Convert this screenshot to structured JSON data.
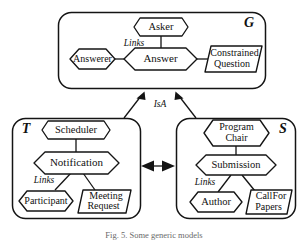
{
  "figure": {
    "caption": "Fig. 5.  Some generic models",
    "background_color": "#ffffff",
    "line_color": "#141414"
  },
  "groups": [
    {
      "id": "G",
      "label": "G",
      "label_position": "top-right",
      "link_label": "Links",
      "nodes": [
        {
          "id": "asker",
          "label": "Asker",
          "shape": "hexagon"
        },
        {
          "id": "answer",
          "label": "Answer",
          "shape": "hexagon"
        },
        {
          "id": "answerer",
          "label": "Answerer",
          "shape": "hexagon"
        },
        {
          "id": "constrained-question",
          "label_line1": "Constrained",
          "label_line2": "Question",
          "shape": "parallelogram"
        }
      ]
    },
    {
      "id": "T",
      "label": "T",
      "label_position": "top-left",
      "link_label": "Links",
      "nodes": [
        {
          "id": "scheduler",
          "label": "Scheduler",
          "shape": "hexagon"
        },
        {
          "id": "notification",
          "label": "Notification",
          "shape": "hexagon"
        },
        {
          "id": "participant",
          "label": "Participant",
          "shape": "hexagon"
        },
        {
          "id": "meeting-request",
          "label_line1": "Meeting",
          "label_line2": "Request",
          "shape": "parallelogram"
        }
      ]
    },
    {
      "id": "S",
      "label": "S",
      "label_position": "top-right",
      "link_label": "Links",
      "nodes": [
        {
          "id": "program-chair",
          "label_line1": "Program",
          "label_line2": "Chair",
          "shape": "hexagon"
        },
        {
          "id": "submission",
          "label": "Submission",
          "shape": "hexagon"
        },
        {
          "id": "author",
          "label": "Author",
          "shape": "hexagon"
        },
        {
          "id": "callfor-papers",
          "label_line1": "CallFor",
          "label_line2": "Papers",
          "shape": "parallelogram"
        }
      ]
    }
  ],
  "relations": [
    {
      "id": "isa",
      "label": "IsA",
      "from": [
        "T",
        "S"
      ],
      "to": "G",
      "arrow": "single"
    },
    {
      "id": "t-s-link",
      "label": "",
      "from": "T",
      "to": "S",
      "arrow": "double"
    }
  ]
}
